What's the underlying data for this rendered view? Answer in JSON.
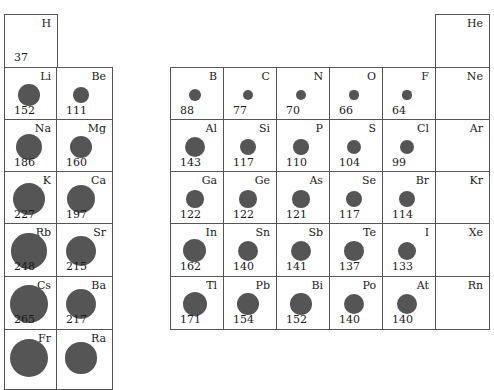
{
  "dot_color": "#555555",
  "elements": [
    {
      "symbol": "H",
      "radius": 37,
      "col": 1,
      "row": 1
    },
    {
      "symbol": "He",
      "radius": null,
      "col": 18,
      "row": 1
    },
    {
      "symbol": "Li",
      "radius": 152,
      "col": 1,
      "row": 2
    },
    {
      "symbol": "Be",
      "radius": 111,
      "col": 2,
      "row": 2
    },
    {
      "symbol": "B",
      "radius": 88,
      "col": 13,
      "row": 2
    },
    {
      "symbol": "C",
      "radius": 77,
      "col": 14,
      "row": 2
    },
    {
      "symbol": "N",
      "radius": 70,
      "col": 15,
      "row": 2
    },
    {
      "symbol": "O",
      "radius": 66,
      "col": 16,
      "row": 2
    },
    {
      "symbol": "F",
      "radius": 64,
      "col": 17,
      "row": 2
    },
    {
      "symbol": "Ne",
      "radius": null,
      "col": 18,
      "row": 2
    },
    {
      "symbol": "Na",
      "radius": 186,
      "col": 1,
      "row": 3
    },
    {
      "symbol": "Mg",
      "radius": 160,
      "col": 2,
      "row": 3
    },
    {
      "symbol": "Al",
      "radius": 143,
      "col": 13,
      "row": 3
    },
    {
      "symbol": "Si",
      "radius": 117,
      "col": 14,
      "row": 3
    },
    {
      "symbol": "P",
      "radius": 110,
      "col": 15,
      "row": 3
    },
    {
      "symbol": "S",
      "radius": 104,
      "col": 16,
      "row": 3
    },
    {
      "symbol": "Cl",
      "radius": 99,
      "col": 17,
      "row": 3
    },
    {
      "symbol": "Ar",
      "radius": null,
      "col": 18,
      "row": 3
    },
    {
      "symbol": "K",
      "radius": 227,
      "col": 1,
      "row": 4
    },
    {
      "symbol": "Ca",
      "radius": 197,
      "col": 2,
      "row": 4
    },
    {
      "symbol": "Ga",
      "radius": 122,
      "col": 13,
      "row": 4
    },
    {
      "symbol": "Ge",
      "radius": 122,
      "col": 14,
      "row": 4
    },
    {
      "symbol": "As",
      "radius": 121,
      "col": 15,
      "row": 4
    },
    {
      "symbol": "Se",
      "radius": 117,
      "col": 16,
      "row": 4
    },
    {
      "symbol": "Br",
      "radius": 114,
      "col": 17,
      "row": 4
    },
    {
      "symbol": "Kr",
      "radius": null,
      "col": 18,
      "row": 4
    },
    {
      "symbol": "Rb",
      "radius": 248,
      "col": 1,
      "row": 5
    },
    {
      "symbol": "Sr",
      "radius": 215,
      "col": 2,
      "row": 5
    },
    {
      "symbol": "In",
      "radius": 162,
      "col": 13,
      "row": 5
    },
    {
      "symbol": "Sn",
      "radius": 140,
      "col": 14,
      "row": 5
    },
    {
      "symbol": "Sb",
      "radius": 141,
      "col": 15,
      "row": 5
    },
    {
      "symbol": "Te",
      "radius": 137,
      "col": 16,
      "row": 5
    },
    {
      "symbol": "I",
      "radius": 133,
      "col": 17,
      "row": 5
    },
    {
      "symbol": "Xe",
      "radius": null,
      "col": 18,
      "row": 5
    },
    {
      "symbol": "Cs",
      "radius": 265,
      "col": 1,
      "row": 6
    },
    {
      "symbol": "Ba",
      "radius": 217,
      "col": 2,
      "row": 6
    },
    {
      "symbol": "Tl",
      "radius": 171,
      "col": 13,
      "row": 6
    },
    {
      "symbol": "Pb",
      "radius": 154,
      "col": 14,
      "row": 6
    },
    {
      "symbol": "Bi",
      "radius": 152,
      "col": 15,
      "row": 6
    },
    {
      "symbol": "Po",
      "radius": 140,
      "col": 16,
      "row": 6
    },
    {
      "symbol": "At",
      "radius": 140,
      "col": 17,
      "row": 6
    },
    {
      "symbol": "Rn",
      "radius": null,
      "col": 18,
      "row": 6
    },
    {
      "symbol": "Fr",
      "radius": null,
      "col": 1,
      "row": 7,
      "dot_hint": 270
    },
    {
      "symbol": "Ra",
      "radius": null,
      "col": 2,
      "row": 7,
      "dot_hint": 220
    }
  ]
}
